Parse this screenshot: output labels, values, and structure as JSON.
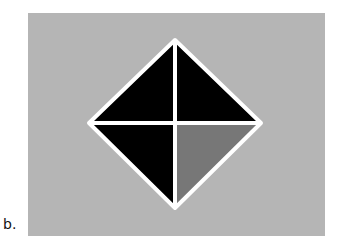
{
  "figure": {
    "caption": "b.",
    "background_color": "#b5b5b5",
    "stroke_color": "#ffffff",
    "quadrants": [
      {
        "name": "top-left",
        "color": "#000000"
      },
      {
        "name": "top-right",
        "color": "#000000"
      },
      {
        "name": "bottom-left",
        "color": "#000000"
      },
      {
        "name": "bottom-right",
        "color": "#777777"
      }
    ]
  }
}
